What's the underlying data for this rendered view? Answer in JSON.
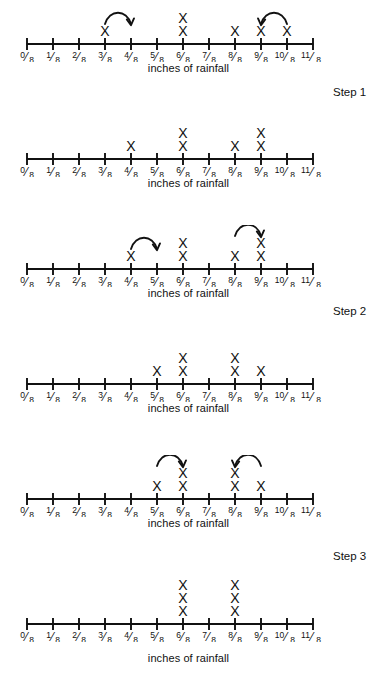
{
  "figure": {
    "title_visible": false,
    "background_color": "#ffffff",
    "ink_color": "#111111",
    "axis_caption": "inches of rainfall",
    "tick_labels": [
      "0/8",
      "1/8",
      "2/8",
      "3/8",
      "4/8",
      "5/8",
      "6/8",
      "7/8",
      "8/8",
      "9/8",
      "10/8",
      "11/8"
    ],
    "tick_numerators": [
      "0",
      "1",
      "2",
      "3",
      "4",
      "5",
      "6",
      "7",
      "8",
      "9",
      "10",
      "11"
    ],
    "tick_denominator": "8",
    "mark_glyph": "X"
  },
  "step_labels": [
    {
      "text": "Step 1"
    },
    {
      "text": "Step 2"
    },
    {
      "text": "Step 3"
    }
  ],
  "chart_data": {
    "type": "dotplot",
    "xlabel": "inches of rainfall",
    "ylabel": "",
    "categories": [
      "0/8",
      "1/8",
      "2/8",
      "3/8",
      "4/8",
      "5/8",
      "6/8",
      "7/8",
      "8/8",
      "9/8",
      "10/8",
      "11/8"
    ],
    "x_values": [
      0,
      0.125,
      0.25,
      0.375,
      0.5,
      0.625,
      0.75,
      0.875,
      1.0,
      1.125,
      1.25,
      1.375
    ],
    "xlim": [
      "0/8",
      "11/8"
    ],
    "grid": false,
    "legend": "none",
    "panels": [
      {
        "index": 1,
        "name": "panel-1-before-step-1",
        "caption": "inches of rainfall",
        "counts": [
          0,
          0,
          0,
          1,
          0,
          0,
          2,
          0,
          1,
          1,
          1,
          0
        ],
        "arcs": [
          {
            "from": "3/8",
            "to": "4/8",
            "from_index": 3,
            "to_index": 4,
            "direction": "right"
          },
          {
            "from": "9/8",
            "to": "10/8",
            "from_index": 9,
            "to_index": 10,
            "direction": "left"
          }
        ]
      },
      {
        "index": 2,
        "name": "panel-2-after-step-1",
        "caption": "inches of rainfall",
        "counts": [
          0,
          0,
          0,
          0,
          1,
          0,
          2,
          0,
          1,
          2,
          0,
          0
        ],
        "arcs": []
      },
      {
        "index": 3,
        "name": "panel-3-before-step-2",
        "caption": "inches of rainfall",
        "counts": [
          0,
          0,
          0,
          0,
          1,
          0,
          2,
          0,
          1,
          2,
          0,
          0
        ],
        "arcs": [
          {
            "from": "4/8",
            "to": "5/8",
            "from_index": 4,
            "to_index": 5,
            "direction": "right"
          },
          {
            "from": "8/8",
            "to": "9/8",
            "from_index": 8,
            "to_index": 9,
            "direction": "right"
          }
        ]
      },
      {
        "index": 4,
        "name": "panel-4-after-step-2",
        "caption": "inches of rainfall",
        "counts": [
          0,
          0,
          0,
          0,
          0,
          1,
          2,
          0,
          2,
          1,
          0,
          0
        ],
        "arcs": []
      },
      {
        "index": 5,
        "name": "panel-5-before-step-3",
        "caption": "inches of rainfall",
        "counts": [
          0,
          0,
          0,
          0,
          0,
          1,
          2,
          0,
          2,
          1,
          0,
          0
        ],
        "arcs": [
          {
            "from": "5/8",
            "to": "6/8",
            "from_index": 5,
            "to_index": 6,
            "direction": "right"
          },
          {
            "from": "8/8",
            "to": "9/8",
            "from_index": 8,
            "to_index": 9,
            "direction": "left"
          }
        ]
      },
      {
        "index": 6,
        "name": "panel-6-after-step-3",
        "caption": "inches of rainfall",
        "counts": [
          0,
          0,
          0,
          0,
          0,
          0,
          3,
          0,
          3,
          0,
          0,
          0
        ],
        "arcs": []
      }
    ]
  },
  "layout": {
    "panel_tops": [
      0,
      115,
      225,
      340,
      455,
      580
    ],
    "axis_y_in_panel": [
      44,
      44,
      44,
      44,
      44,
      44
    ],
    "caption_tops": [
      62,
      177,
      287,
      402,
      517,
      652
    ],
    "step_label_positions": [
      {
        "label_index": 0,
        "top": 86,
        "left": 333
      },
      {
        "label_index": 1,
        "top": 305,
        "left": 333
      },
      {
        "label_index": 2,
        "top": 550,
        "left": 333
      }
    ],
    "axis_x_start": 27,
    "axis_x_end": 313,
    "tick_spacing": 26
  }
}
